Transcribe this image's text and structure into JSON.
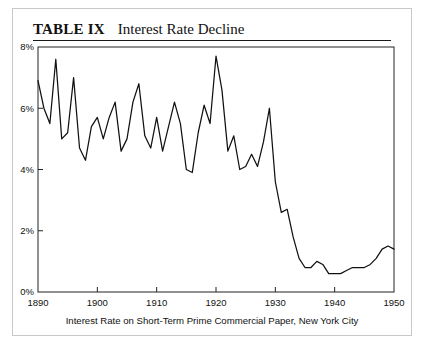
{
  "figure": {
    "table_label": "TABLE IX",
    "title": "Interest Rate Decline",
    "caption": "Interest Rate on Short-Term Prime Commercial Paper, New York City",
    "line_color": "#111111",
    "frame_color": "#222222",
    "border_color": "#c9c9c9",
    "background": "#ffffff"
  },
  "chart_data": {
    "type": "line",
    "title": "Interest Rate Decline",
    "subtitle": "TABLE IX",
    "xlabel": "Interest Rate on Short-Term Prime Commercial Paper, New York City",
    "ylabel": "",
    "xlim": [
      1890,
      1950
    ],
    "ylim": [
      0,
      8
    ],
    "grid": false,
    "legend": "none",
    "xticks": [
      1890,
      1900,
      1910,
      1920,
      1930,
      1940,
      1950
    ],
    "xtick_labels": [
      "1890",
      "1900",
      "1910",
      "1920",
      "1930",
      "1940",
      "1950"
    ],
    "yticks": [
      0,
      2,
      4,
      6,
      8
    ],
    "ytick_labels": [
      "0%",
      "2%",
      "4%",
      "6%",
      "8%"
    ],
    "series": [
      {
        "name": "Short-term prime commercial paper rate",
        "x": [
          1890,
          1891,
          1892,
          1893,
          1894,
          1895,
          1896,
          1897,
          1898,
          1899,
          1900,
          1901,
          1902,
          1903,
          1904,
          1905,
          1906,
          1907,
          1908,
          1909,
          1910,
          1911,
          1912,
          1913,
          1914,
          1915,
          1916,
          1917,
          1918,
          1919,
          1920,
          1921,
          1922,
          1923,
          1924,
          1925,
          1926,
          1927,
          1928,
          1929,
          1930,
          1931,
          1932,
          1933,
          1934,
          1935,
          1936,
          1937,
          1938,
          1939,
          1940,
          1941,
          1942,
          1943,
          1944,
          1945,
          1946,
          1947,
          1948,
          1949,
          1950
        ],
        "values": [
          6.9,
          6.0,
          5.5,
          7.6,
          5.0,
          5.2,
          7.0,
          4.7,
          4.3,
          5.4,
          5.7,
          5.0,
          5.7,
          6.2,
          4.6,
          5.0,
          6.2,
          6.8,
          5.1,
          4.7,
          5.7,
          4.6,
          5.4,
          6.2,
          5.5,
          4.0,
          3.9,
          5.2,
          6.1,
          5.5,
          7.7,
          6.6,
          4.6,
          5.1,
          4.0,
          4.1,
          4.5,
          4.1,
          4.9,
          6.0,
          3.6,
          2.6,
          2.7,
          1.8,
          1.1,
          0.8,
          0.8,
          1.0,
          0.9,
          0.6,
          0.6,
          0.6,
          0.7,
          0.8,
          0.8,
          0.8,
          0.9,
          1.1,
          1.4,
          1.5,
          1.4
        ]
      }
    ]
  }
}
